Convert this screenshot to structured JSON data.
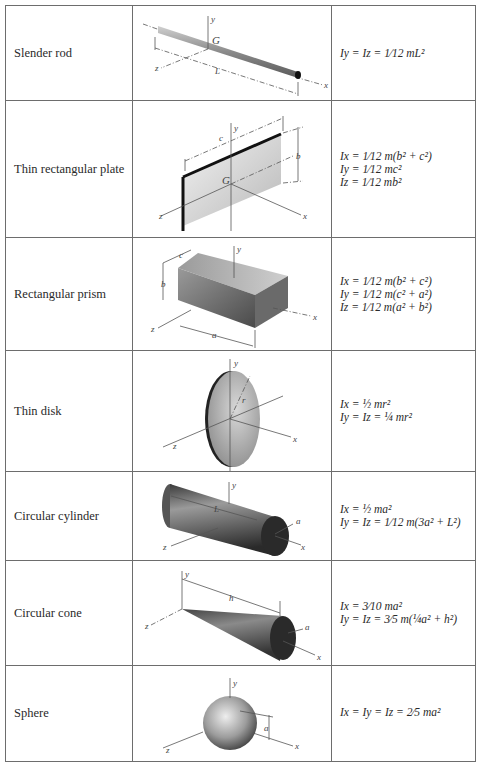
{
  "table": {
    "rows": [
      {
        "name": "Slender rod",
        "figure": "slender-rod",
        "labels": {
          "y": "y",
          "G": "G",
          "z": "z",
          "L": "L",
          "x": "x"
        },
        "formulas": [
          "I_y = I_z = (1/12) m L²"
        ],
        "formulas_display": [
          "Iy = Iz = 1⁄12 mL²"
        ]
      },
      {
        "name": "Thin rectangular plate",
        "figure": "thin-rectangular-plate",
        "labels": {
          "y": "y",
          "c": "c",
          "b": "b",
          "G": "G",
          "z": "z",
          "x": "x"
        },
        "formulas_display": [
          "Ix = 1⁄12 m(b² + c²)",
          "Iy = 1⁄12 mc²",
          "Iz = 1⁄12 mb²"
        ]
      },
      {
        "name": "Rectangular prism",
        "figure": "rectangular-prism",
        "labels": {
          "y": "y",
          "c": "c",
          "b": "b",
          "a": "a",
          "z": "z",
          "x": "x"
        },
        "formulas_display": [
          "Ix = 1⁄12 m(b² + c²)",
          "Iy = 1⁄12 m(c² + a²)",
          "Iz = 1⁄12 m(a² + b²)"
        ]
      },
      {
        "name": "Thin disk",
        "figure": "thin-disk",
        "labels": {
          "y": "y",
          "r": "r",
          "z": "z",
          "x": "x"
        },
        "formulas_display": [
          "Ix = ½ mr²",
          "Iy = Iz = ¼ mr²"
        ]
      },
      {
        "name": "Circular cylinder",
        "figure": "circular-cylinder",
        "labels": {
          "y": "y",
          "L": "L",
          "a": "a",
          "z": "z",
          "x": "x"
        },
        "formulas_display": [
          "Ix = ½ ma²",
          "Iy = Iz = 1⁄12 m(3a² + L²)"
        ]
      },
      {
        "name": "Circular cone",
        "figure": "circular-cone",
        "labels": {
          "y": "y",
          "h": "h",
          "a": "a",
          "z": "z",
          "x": "x"
        },
        "formulas_display": [
          "Ix = 3⁄10 ma²",
          "Iy = Iz = 3⁄5 m(¼a² + h²)"
        ]
      },
      {
        "name": "Sphere",
        "figure": "sphere",
        "labels": {
          "y": "y",
          "a": "a",
          "z": "z",
          "x": "x"
        },
        "formulas_display": [
          "Ix = Iy = Iz = 2⁄5 ma²"
        ]
      }
    ]
  }
}
